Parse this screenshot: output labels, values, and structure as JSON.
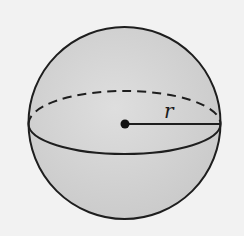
{
  "figure": {
    "radius_label": "r",
    "colors": {
      "background": "#f2f2f2",
      "sphere_fill": "#d4d4d4",
      "stroke": "#1e1e1e"
    }
  }
}
